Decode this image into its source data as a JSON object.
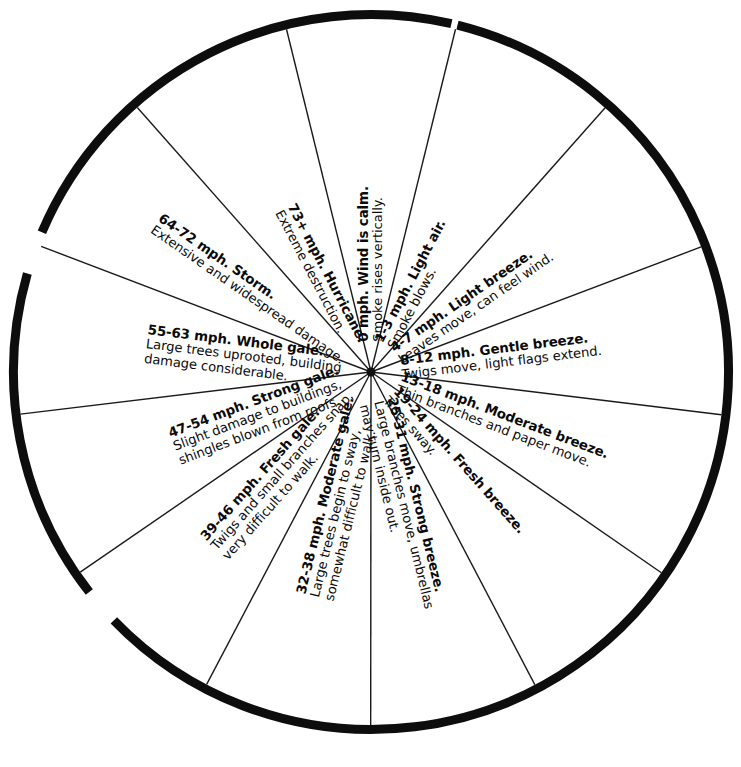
{
  "chart_data": {
    "type": "pie",
    "xlabel": "",
    "ylabel": "",
    "legend": "none",
    "grid": false,
    "note": "Thirteen equal 27.7-degree wedges radiating from a common center; each wedge is labelled with a wind speed range in mph, the Beaufort force name, and an observable-effects description.",
    "categories": [
      "0 mph",
      "1-3 mph",
      "4-7 mph",
      "8-12 mph",
      "13-18 mph",
      "19-24 mph",
      "25-31 mph",
      "32-38 mph",
      "39-46 mph",
      "47-54 mph",
      "55-63 mph",
      "64-72 mph",
      "73+ mph"
    ],
    "values": [
      1,
      1,
      1,
      1,
      1,
      1,
      1,
      1,
      1,
      1,
      1,
      1,
      1
    ],
    "series": [
      {
        "name": "Wind speed lower bound (mph)",
        "values": [
          0,
          1,
          4,
          8,
          13,
          19,
          25,
          32,
          39,
          47,
          55,
          64,
          73
        ]
      },
      {
        "name": "Wind speed upper bound (mph)",
        "values": [
          0,
          3,
          7,
          12,
          18,
          24,
          31,
          38,
          46,
          54,
          63,
          72,
          null
        ]
      }
    ]
  },
  "wheel": {
    "center_x": 371,
    "center_y": 372,
    "radius": 362,
    "ring_thickness": 9,
    "segment_count": 13,
    "segment_sweep_degrees": 27.7,
    "colors": {
      "ink": "#0a0a0a",
      "ring": "#0d0d0d",
      "spoke": "#1a1a1a",
      "background": "#ffffff"
    }
  },
  "segments": [
    {
      "id": "calm",
      "speed": "0 mph.",
      "force_name": "Wind is calm.",
      "title": "0 mph. Wind is calm.",
      "description": "Smoke rises vertically.",
      "description_line2": "",
      "angle": -90,
      "flip": false,
      "radius_start": 30,
      "title_offset": 0
    },
    {
      "id": "light-air",
      "speed": "1-3 mph.",
      "force_name": "Light air.",
      "title": "1-3 mph. Light air.",
      "description": "Smoke blows.",
      "description_line2": "",
      "angle": -62.3,
      "flip": false,
      "radius_start": 30,
      "title_offset": 0
    },
    {
      "id": "light-breeze",
      "speed": "4-7 mph.",
      "force_name": "Light breeze.",
      "title": "4-7 mph. Light breeze.",
      "description": "Leaves move, can feel wind.",
      "description_line2": "",
      "angle": -34.6,
      "flip": false,
      "radius_start": 30,
      "title_offset": 0
    },
    {
      "id": "gentle-breeze",
      "speed": "8-12 mph.",
      "force_name": "Gentle breeze.",
      "title": "8-12 mph. Gentle breeze.",
      "description": "Twigs move, light flags extend.",
      "description_line2": "",
      "angle": -6.9,
      "flip": false,
      "radius_start": 30,
      "title_offset": 0
    },
    {
      "id": "moderate-breeze",
      "speed": "13-18 mph.",
      "force_name": "Moderate breeze.",
      "title": "13-18 mph. Moderate breeze.",
      "description": "Thin branches and paper move.",
      "description_line2": "",
      "angle": 20.8,
      "flip": false,
      "radius_start": 30,
      "title_offset": 0
    },
    {
      "id": "fresh-breeze",
      "speed": "19-24 mph.",
      "force_name": "Fresh breeze.",
      "title": "19-24 mph. Fresh breeze.",
      "description": "Trees sway.",
      "description_line2": "",
      "angle": 48.5,
      "flip": false,
      "radius_start": 30,
      "title_offset": 0
    },
    {
      "id": "strong-breeze",
      "speed": "25-31 mph.",
      "force_name": "Strong breeze.",
      "title": "25-31 mph. Strong breeze.",
      "description": "Large branches move, umbrellas",
      "description_line2": "may turn inside out.",
      "angle": 76.2,
      "flip": false,
      "radius_start": 30,
      "title_offset": 0
    },
    {
      "id": "moderate-gale",
      "speed": "32-38 mph.",
      "force_name": "Moderate gale.",
      "title": "32-38 mph. Moderate gale.",
      "description": "Large trees begin to sway,",
      "description_line2": "somewhat difficult to walk.",
      "angle": 103.9,
      "flip": true,
      "radius_start": 30,
      "title_offset": 0
    },
    {
      "id": "fresh-gale",
      "speed": "39-46 mph.",
      "force_name": "Fresh gale.",
      "title": "39-46 mph. Fresh gale.",
      "description": "Twigs and small branches snap,",
      "description_line2": "very difficult to walk.",
      "angle": 131.6,
      "flip": true,
      "radius_start": 30,
      "title_offset": 0
    },
    {
      "id": "strong-gale",
      "speed": "47-54 mph.",
      "force_name": "Strong gale.",
      "title": "47-54 mph. Strong gale.",
      "description": "Slight damage to buildings,",
      "description_line2": "shingles blown from roofs.",
      "angle": 159.3,
      "flip": true,
      "radius_start": 30,
      "title_offset": 0
    },
    {
      "id": "whole-gale",
      "speed": "55-63 mph.",
      "force_name": "Whole gale.",
      "title": "55-63 mph. Whole gale.",
      "description": "Large trees uprooted, building",
      "description_line2": "damage considerable.",
      "angle": -173,
      "flip": true,
      "radius_start": 30,
      "title_offset": 0
    },
    {
      "id": "storm",
      "speed": "64-72 mph.",
      "force_name": "Storm.",
      "title": "64-72 mph. Storm.",
      "description": "Extensive and widespread damage.",
      "description_line2": "",
      "angle": -145.3,
      "flip": true,
      "radius_start": 30,
      "title_offset": 0
    },
    {
      "id": "hurricane",
      "speed": "73+ mph.",
      "force_name": "Hurricane.",
      "title": "73+ mph. Hurricane.",
      "description": "Extreme destruction.",
      "description_line2": "",
      "angle": -117.6,
      "flip": true,
      "radius_start": 30,
      "title_offset": 0
    }
  ],
  "outer_ring": {
    "arcs": [
      {
        "start_deg": -76,
        "end_deg": 136
      },
      {
        "start_deg": 142,
        "end_deg": 196
      },
      {
        "start_deg": 203,
        "end_deg": 283
      }
    ]
  }
}
